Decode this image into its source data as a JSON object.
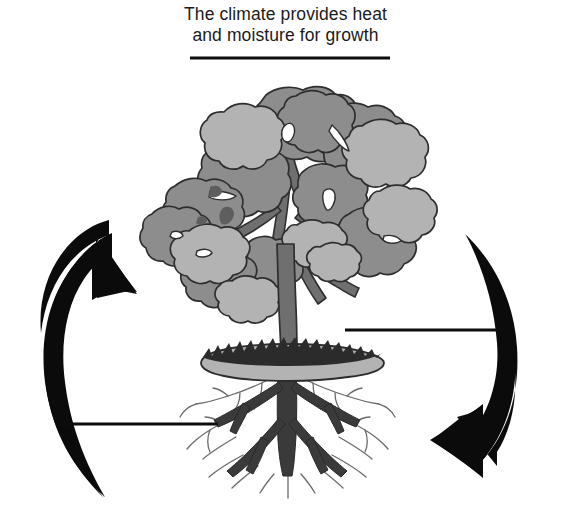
{
  "page": {
    "title": "The climate provides heat and moisture for growth",
    "background_color": "#ffffff",
    "width": 571,
    "height": 518
  },
  "caption": {
    "line1": "The climate provides heat",
    "line2": "and moisture for growth",
    "text_color": "#1b1b1b"
  },
  "blanks": [
    {
      "id": "blank-top",
      "label": "answer line under caption",
      "x1": 190,
      "y1": 58,
      "x2": 390,
      "y2": 58
    },
    {
      "id": "blank-right",
      "label": "answer line at right of trunk",
      "x1": 345,
      "y1": 330,
      "x2": 505,
      "y2": 330
    },
    {
      "id": "blank-left",
      "label": "answer line at left of roots",
      "x1": 62,
      "y1": 424,
      "x2": 218,
      "y2": 424
    }
  ],
  "arrows": {
    "left": {
      "name": "left-cycle-arrow",
      "direction": "up-right",
      "color": "#0b0b0b",
      "description": "thick curved arrow sweeping up the left side, arrowhead pointing up and to the right"
    },
    "right": {
      "name": "right-cycle-arrow",
      "direction": "down-left",
      "color": "#0b0b0b",
      "description": "thick curved arrow sweeping down the right side, arrowhead pointing down and to the left"
    }
  },
  "tree": {
    "name": "tree-illustration",
    "canopy": {
      "fill_medium": "#8d8d8d",
      "fill_light": "#b3b3b3",
      "outline": "#2e2e2e"
    },
    "branches": {
      "fill": "#6f6f6f",
      "outline": "#2e2e2e"
    },
    "trunk": {
      "fill": "#6f6f6f",
      "outline": "#2e2e2e"
    },
    "ground": {
      "fill": "#b3b3b3",
      "outline": "#2b2b2b",
      "grass_edge": "jagged"
    },
    "roots": {
      "main_fill": "#3a3a3a",
      "hair_root_color": "#5a5a5a"
    }
  },
  "line_style": {
    "blank_color": "#0d0d0d",
    "blank_thickness": 3
  }
}
